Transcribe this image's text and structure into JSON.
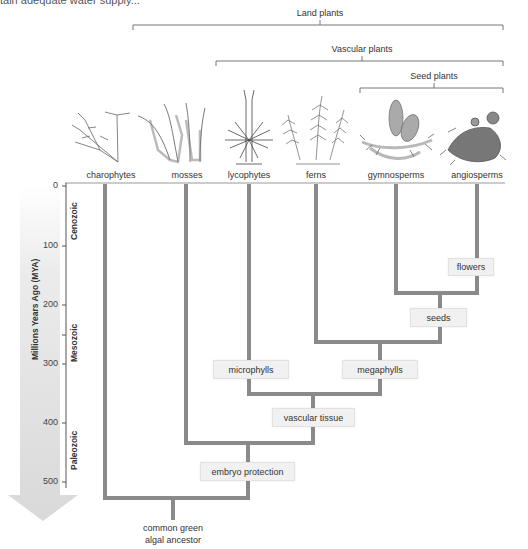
{
  "caption_fragment": "tain adequate water supply...",
  "brackets": [
    {
      "label": "Land plants",
      "x1": 133,
      "x2": 503,
      "y": 25,
      "label_x": 320,
      "label_y": 9
    },
    {
      "label": "Vascular plants",
      "x1": 216,
      "x2": 503,
      "y": 61,
      "label_x": 362,
      "label_y": 45
    },
    {
      "label": "Seed plants",
      "x1": 360,
      "x2": 503,
      "y": 88,
      "label_x": 434,
      "label_y": 72
    }
  ],
  "taxa": [
    {
      "name": "charophytes",
      "x": 105
    },
    {
      "name": "mosses",
      "x": 186
    },
    {
      "name": "lycophytes",
      "x": 249
    },
    {
      "name": "ferns",
      "x": 316
    },
    {
      "name": "gymnosperms",
      "x": 396
    },
    {
      "name": "angiosperms",
      "x": 477
    }
  ],
  "axis": {
    "title": "Millions Years Ago (MYA)",
    "ticks": [
      {
        "label": "0",
        "y": 186
      },
      {
        "label": "100",
        "y": 246
      },
      {
        "label": "200",
        "y": 305
      },
      {
        "label": "300",
        "y": 364
      },
      {
        "label": "400",
        "y": 423
      },
      {
        "label": "500",
        "y": 482
      }
    ],
    "eras": [
      {
        "label": "Cenozoic",
        "y": 230
      },
      {
        "label": "Mesozoic",
        "y": 345
      },
      {
        "label": "Paleozoic",
        "y": 447
      }
    ]
  },
  "traits": [
    {
      "label": "flowers",
      "x": 448,
      "y": 258,
      "w": 46,
      "h": 18
    },
    {
      "label": "seeds",
      "x": 410,
      "y": 308,
      "w": 57,
      "h": 19
    },
    {
      "label": "microphylls",
      "x": 213,
      "y": 360,
      "w": 76,
      "h": 19
    },
    {
      "label": "megaphylls",
      "x": 342,
      "y": 360,
      "w": 76,
      "h": 19
    },
    {
      "label": "vascular tissue",
      "x": 272,
      "y": 408,
      "w": 83,
      "h": 19
    },
    {
      "label": "embryo protection",
      "x": 200,
      "y": 462,
      "w": 95,
      "h": 19
    }
  ],
  "ancestor": {
    "line1": "common green",
    "line2": "algal ancestor",
    "x": 173,
    "y": 522
  },
  "colors": {
    "branch": "#8a8a8a",
    "bracket": "#777777",
    "arrow": "#e4e4e4",
    "trait_fill": "#f1f1f1"
  }
}
